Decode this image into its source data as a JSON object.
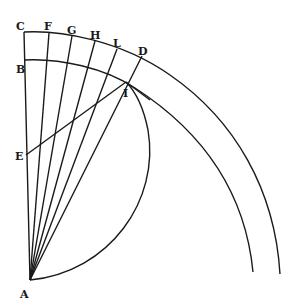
{
  "figure": {
    "type": "geometric-diagram",
    "stroke_color": "#1a1a1a",
    "background": "#ffffff",
    "points": {
      "A": {
        "label": "A",
        "x": 30,
        "y": 280
      },
      "B": {
        "label": "B",
        "x": 24,
        "y": 60
      },
      "C": {
        "label": "C",
        "x": 24,
        "y": 32
      },
      "D": {
        "label": "D",
        "x": 142,
        "y": 56
      },
      "E": {
        "label": "E",
        "x": 26,
        "y": 155
      },
      "F": {
        "label": "F",
        "x": 49,
        "y": 33
      },
      "G": {
        "label": "G",
        "x": 72,
        "y": 36
      },
      "H": {
        "label": "H",
        "x": 95,
        "y": 41
      },
      "L": {
        "label": "L",
        "x": 117,
        "y": 49
      },
      "I": {
        "label": "I",
        "x": 126,
        "y": 82
      }
    },
    "labels": [
      {
        "id": "C",
        "text": "C",
        "x": 16,
        "y": 30
      },
      {
        "id": "F",
        "text": "F",
        "x": 44,
        "y": 30
      },
      {
        "id": "G",
        "text": "G",
        "x": 67,
        "y": 34
      },
      {
        "id": "H",
        "text": "H",
        "x": 90,
        "y": 39
      },
      {
        "id": "L",
        "text": "L",
        "x": 113,
        "y": 47
      },
      {
        "id": "D",
        "text": "D",
        "x": 138,
        "y": 55
      },
      {
        "id": "B",
        "text": "B",
        "x": 16,
        "y": 73
      },
      {
        "id": "I",
        "text": "I",
        "x": 123,
        "y": 97
      },
      {
        "id": "E",
        "text": "E",
        "x": 15,
        "y": 160
      },
      {
        "id": "A",
        "text": "A",
        "x": 20,
        "y": 298
      }
    ]
  }
}
